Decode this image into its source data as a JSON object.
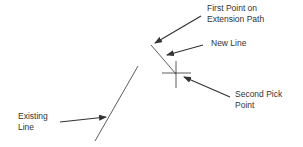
{
  "diagram": {
    "labels": {
      "first_point_line1": "First Point on",
      "first_point_line2": "Extension Path",
      "new_line": "New Line",
      "second_pick_line1": "Second Pick",
      "second_pick_line2": "Point",
      "existing_line1": "Existing",
      "existing_line2": "Line"
    },
    "colors": {
      "stroke": "#333333",
      "background": "#ffffff"
    }
  }
}
